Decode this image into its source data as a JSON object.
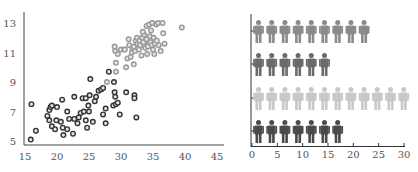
{
  "chart_data": [
    {
      "type": "scatter",
      "title": "",
      "xlabel": "",
      "ylabel": "",
      "xlim": [
        15,
        45
      ],
      "ylim": [
        5,
        13.5
      ],
      "xticks": [
        15,
        20,
        25,
        30,
        35,
        40,
        45
      ],
      "yticks": [
        5,
        7,
        9,
        11,
        13
      ],
      "grid": false,
      "legend": null,
      "series": [
        {
          "name": "dark",
          "color": "#333333",
          "points": [
            [
              15.9,
              5.1
            ],
            [
              16.0,
              7.5
            ],
            [
              16.7,
              5.7
            ],
            [
              18.5,
              6.7
            ],
            [
              18.8,
              7.1
            ],
            [
              19.0,
              7.3
            ],
            [
              19.2,
              7.4
            ],
            [
              18.8,
              6.4
            ],
            [
              19.2,
              6.0
            ],
            [
              19.7,
              5.8
            ],
            [
              20.0,
              7.3
            ],
            [
              19.9,
              6.4
            ],
            [
              20.6,
              6.3
            ],
            [
              20.8,
              7.8
            ],
            [
              20.9,
              5.9
            ],
            [
              21.0,
              5.4
            ],
            [
              21.6,
              7.0
            ],
            [
              21.6,
              5.8
            ],
            [
              21.9,
              6.5
            ],
            [
              22.5,
              5.5
            ],
            [
              22.7,
              8.0
            ],
            [
              22.7,
              6.5
            ],
            [
              23.2,
              6.2
            ],
            [
              23.4,
              6.6
            ],
            [
              23.7,
              6.9
            ],
            [
              24.0,
              7.9
            ],
            [
              24.2,
              7.0
            ],
            [
              24.5,
              6.4
            ],
            [
              24.5,
              7.9
            ],
            [
              24.7,
              5.9
            ],
            [
              24.9,
              7.4
            ],
            [
              25.1,
              8.1
            ],
            [
              25.2,
              9.2
            ],
            [
              25.0,
              7.0
            ],
            [
              25.6,
              6.3
            ],
            [
              25.9,
              7.7
            ],
            [
              26.1,
              8.0
            ],
            [
              26.5,
              8.4
            ],
            [
              26.9,
              8.5
            ],
            [
              27.2,
              8.6
            ],
            [
              27.2,
              6.8
            ],
            [
              27.6,
              7.2
            ],
            [
              27.6,
              6.2
            ],
            [
              28.1,
              9.7
            ],
            [
              28.9,
              9.0
            ],
            [
              29.0,
              8.3
            ],
            [
              28.8,
              7.4
            ],
            [
              29.2,
              7.5
            ],
            [
              29.5,
              7.6
            ],
            [
              29.8,
              6.8
            ],
            [
              30.8,
              8.3
            ],
            [
              32.1,
              8.1
            ],
            [
              32.1,
              7.9
            ],
            [
              32.4,
              6.6
            ],
            [
              29.1,
              8.0
            ]
          ]
        },
        {
          "name": "light",
          "color": "#999999",
          "points": [
            [
              27.8,
              9.0
            ],
            [
              29.2,
              9.7
            ],
            [
              29.2,
              10.3
            ],
            [
              29.0,
              11.4
            ],
            [
              29.1,
              11.1
            ],
            [
              29.5,
              10.9
            ],
            [
              30.0,
              11.2
            ],
            [
              30.5,
              11.2
            ],
            [
              30.8,
              10.0
            ],
            [
              31.0,
              10.6
            ],
            [
              31.2,
              11.9
            ],
            [
              31.3,
              11.5
            ],
            [
              31.5,
              10.7
            ],
            [
              31.7,
              11.0
            ],
            [
              31.8,
              11.3
            ],
            [
              32.0,
              10.2
            ],
            [
              32.2,
              11.1
            ],
            [
              32.3,
              11.8
            ],
            [
              32.5,
              12.0
            ],
            [
              32.6,
              11.6
            ],
            [
              32.8,
              11.2
            ],
            [
              32.9,
              11.8
            ],
            [
              33.0,
              11.5
            ],
            [
              33.2,
              10.8
            ],
            [
              33.3,
              12.0
            ],
            [
              33.5,
              11.7
            ],
            [
              33.6,
              12.2
            ],
            [
              33.8,
              11.3
            ],
            [
              34.0,
              12.8
            ],
            [
              34.0,
              11.9
            ],
            [
              34.1,
              10.9
            ],
            [
              34.3,
              11.6
            ],
            [
              34.4,
              12.9
            ],
            [
              34.5,
              12.1
            ],
            [
              34.6,
              11.7
            ],
            [
              34.7,
              12.5
            ],
            [
              34.8,
              11.5
            ],
            [
              34.9,
              13.0
            ],
            [
              35.0,
              11.2
            ],
            [
              35.1,
              12.0
            ],
            [
              35.2,
              10.9
            ],
            [
              35.3,
              11.6
            ],
            [
              35.5,
              12.9
            ],
            [
              35.6,
              11.8
            ],
            [
              35.8,
              13.0
            ],
            [
              35.9,
              11.5
            ],
            [
              36.2,
              11.1
            ],
            [
              36.5,
              13.0
            ],
            [
              36.6,
              12.3
            ],
            [
              36.8,
              11.6
            ],
            [
              39.5,
              12.7
            ],
            [
              33.4,
              12.4
            ],
            [
              32.0,
              11.4
            ],
            [
              30.6,
              11.2
            ],
            [
              34.2,
              11.4
            ]
          ]
        }
      ]
    },
    {
      "type": "pictograph",
      "title": "",
      "xlabel": "",
      "ylabel": "",
      "xlim": [
        0,
        30
      ],
      "xticks": [
        0,
        5,
        10,
        15,
        20,
        25,
        30
      ],
      "unit_value": 2.5,
      "grid": false,
      "legend": null,
      "rows": [
        {
          "index": 1,
          "count": 9,
          "value": 22.5,
          "color": "#8a8a8a"
        },
        {
          "index": 2,
          "count": 6,
          "value": 15,
          "color": "#6a6a6a"
        },
        {
          "index": 3,
          "count": 12,
          "value": 30,
          "color": "#c8c8c8"
        },
        {
          "index": 4,
          "count": 7,
          "value": 17.5,
          "color": "#4a4a4a"
        }
      ]
    }
  ]
}
